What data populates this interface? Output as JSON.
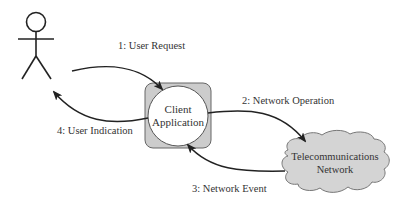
{
  "diagram": {
    "actor": {
      "name": "User"
    },
    "client": {
      "line1": "Client",
      "line2": "Application"
    },
    "network": {
      "line1": "Telecommunications",
      "line2": "Network"
    },
    "edges": [
      {
        "id": 1,
        "label": "1: User Request",
        "from": "User",
        "to": "Client Application"
      },
      {
        "id": 2,
        "label": "2: Network Operation",
        "from": "Client Application",
        "to": "Telecommunications Network"
      },
      {
        "id": 3,
        "label": "3: Network Event",
        "from": "Telecommunications Network",
        "to": "Client Application"
      },
      {
        "id": 4,
        "label": "4: User Indication",
        "from": "Client Application",
        "to": "User"
      }
    ],
    "colors": {
      "line": "#222222",
      "client_box_fill": "#cccccc",
      "client_circle_fill": "#ffffff",
      "cloud_fill": "#d4d4d4",
      "text": "#333333"
    }
  }
}
